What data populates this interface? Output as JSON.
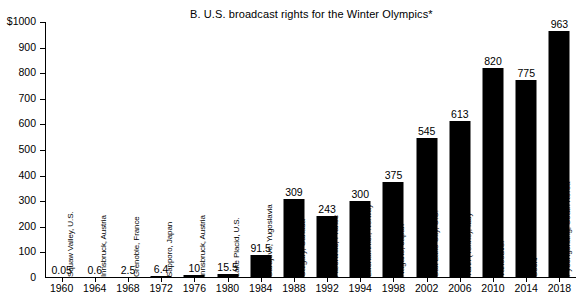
{
  "chart_data": {
    "type": "bar",
    "title": "B.  U.S. broadcast rights for the Winter Olympics*",
    "xlabel": "",
    "ylabel": "",
    "ylim": [
      0,
      1000
    ],
    "ytick_labels": [
      "$1000",
      "900",
      "800",
      "700",
      "600",
      "500",
      "400",
      "300",
      "200",
      "100",
      "0"
    ],
    "ytick_values": [
      1000,
      900,
      800,
      700,
      600,
      500,
      400,
      300,
      200,
      100,
      0
    ],
    "grid": false,
    "legend": "none",
    "categories": [
      "1960",
      "1964",
      "1968",
      "1972",
      "1976",
      "1980",
      "1984",
      "1988",
      "1992",
      "1994",
      "1998",
      "2002",
      "2006",
      "2010",
      "2014",
      "2018"
    ],
    "values": [
      0.05,
      0.6,
      2.5,
      6.4,
      10,
      15.5,
      91.5,
      309,
      243,
      300,
      375,
      545,
      613,
      820,
      775,
      963
    ],
    "value_labels": [
      "0.05",
      "0.6",
      "2.5",
      "6.4",
      "10",
      "15.5",
      "91.5",
      "309",
      "243",
      "300",
      "375",
      "545",
      "613",
      "820",
      "775",
      "963"
    ],
    "point_labels": [
      "Squaw Valley, U.S.",
      "Innsbruck, Austria",
      "Grenoble, France",
      "Sapporo, Japan",
      "Innsbruck, Austria",
      "Lake Placid, U.S.",
      "Sarajevo, Yugoslavia",
      "Calgary, Canada",
      "Albertville, France",
      "Lillehammer, Norway",
      "Nagano, Japan",
      "Salt Lake City, U.S.",
      "Turin (Torino), Italy",
      "Vancouver",
      "Sochi",
      "Pyeongchang, South Korea"
    ],
    "bar_color": "#000000",
    "background_color": "#ffffff"
  }
}
